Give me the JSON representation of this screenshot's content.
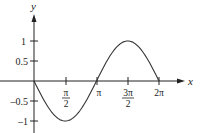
{
  "chart_data": {
    "type": "line",
    "title": "",
    "xlabel": "x",
    "ylabel": "y",
    "function": "y = -sin(x)",
    "x_range": [
      0,
      6.2832
    ],
    "ylim": [
      -1,
      1
    ],
    "grid": false,
    "legend": null,
    "x_ticks": [
      {
        "value": 1.5708,
        "label_num": "π",
        "label_den": "2"
      },
      {
        "value": 3.1416,
        "label": "π"
      },
      {
        "value": 4.7124,
        "label_num": "3π",
        "label_den": "2"
      },
      {
        "value": 6.2832,
        "label": "2π"
      }
    ],
    "y_ticks": [
      {
        "value": 1,
        "label": "1"
      },
      {
        "value": 0.5,
        "label": "0.5"
      },
      {
        "value": -0.5,
        "label": "–0.5"
      },
      {
        "value": -1,
        "label": "–1"
      }
    ],
    "series": [
      {
        "name": "-sin(x)",
        "x": [
          0,
          0.7854,
          1.5708,
          2.3562,
          3.1416,
          3.927,
          4.7124,
          5.4978,
          6.2832
        ],
        "values": [
          0,
          -0.707,
          -1,
          -0.707,
          0,
          0.707,
          1,
          0.707,
          0
        ]
      }
    ],
    "color": "#333333"
  }
}
